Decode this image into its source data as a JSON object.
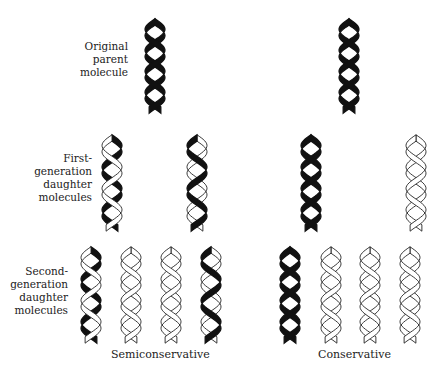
{
  "diagram": {
    "colors": {
      "old_strand": "#111111",
      "new_strand_fill": "#ffffff",
      "new_strand_outline": "#222222"
    },
    "row_labels": [
      {
        "lines": [
          "Original",
          "parent",
          "molecule"
        ]
      },
      {
        "lines": [
          "First-",
          "generation",
          "daughter",
          "molecules"
        ]
      },
      {
        "lines": [
          "Second-",
          "generation",
          "daughter",
          "molecules"
        ]
      }
    ],
    "captions": {
      "semiconservative": "Semiconservative",
      "conservative": "Conservative"
    },
    "models": {
      "semiconservative": {
        "parent": [
          {
            "strand_a": "old",
            "strand_b": "old"
          }
        ],
        "first_generation": [
          {
            "strand_a": "old",
            "strand_b": "new"
          },
          {
            "strand_a": "new",
            "strand_b": "old"
          }
        ],
        "second_generation": [
          {
            "strand_a": "old",
            "strand_b": "new"
          },
          {
            "strand_a": "new",
            "strand_b": "new"
          },
          {
            "strand_a": "new",
            "strand_b": "new"
          },
          {
            "strand_a": "new",
            "strand_b": "old"
          }
        ]
      },
      "conservative": {
        "parent": [
          {
            "strand_a": "old",
            "strand_b": "old"
          }
        ],
        "first_generation": [
          {
            "strand_a": "old",
            "strand_b": "old"
          },
          {
            "strand_a": "new",
            "strand_b": "new"
          }
        ],
        "second_generation": [
          {
            "strand_a": "old",
            "strand_b": "old"
          },
          {
            "strand_a": "new",
            "strand_b": "new"
          },
          {
            "strand_a": "new",
            "strand_b": "new"
          },
          {
            "strand_a": "new",
            "strand_b": "new"
          }
        ]
      }
    }
  }
}
